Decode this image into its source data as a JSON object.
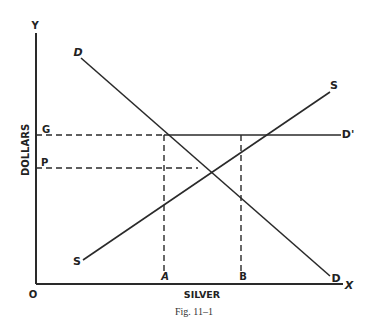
{
  "figure": {
    "caption": "Fig. 11–1",
    "axes": {
      "x_label": "SILVER",
      "y_label": "DOLLARS",
      "x_end_label": "X",
      "y_end_label": "Y",
      "origin_label": "O"
    },
    "curves": {
      "demand": {
        "start_label": "D",
        "end_label": "D"
      },
      "supply": {
        "start_label": "S",
        "end_label": "S"
      },
      "govt_demand": {
        "label": "D'"
      }
    },
    "price_levels": {
      "g": "G",
      "p": "P"
    },
    "quantities": {
      "a": "A",
      "b": "B"
    },
    "colors": {
      "ink": "#2a2a2a",
      "background": "#ffffff"
    }
  }
}
